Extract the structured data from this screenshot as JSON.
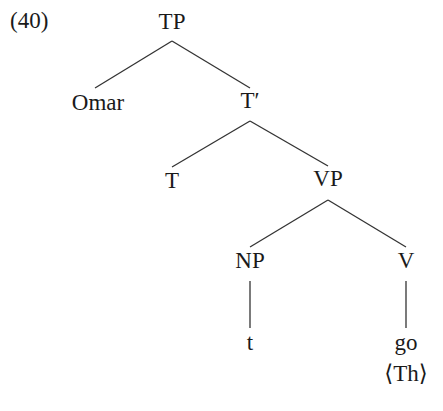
{
  "example_number": "(40)",
  "tree": {
    "nodes": [
      {
        "id": "TP",
        "label": "TP",
        "x": 172,
        "y": 9
      },
      {
        "id": "Omar",
        "label": "Omar",
        "x": 98,
        "y": 90
      },
      {
        "id": "Tbar",
        "label": "T′",
        "x": 250,
        "y": 88
      },
      {
        "id": "T",
        "label": "T",
        "x": 172,
        "y": 168
      },
      {
        "id": "VP",
        "label": "VP",
        "x": 328,
        "y": 166
      },
      {
        "id": "NP",
        "label": "NP",
        "x": 250,
        "y": 248
      },
      {
        "id": "V",
        "label": "V",
        "x": 406,
        "y": 248
      },
      {
        "id": "t",
        "label": "t",
        "x": 250,
        "y": 330
      },
      {
        "id": "go",
        "label": "go",
        "x": 406,
        "y": 330
      },
      {
        "id": "Th",
        "label": "⟨Th⟩",
        "x": 406,
        "y": 361
      }
    ],
    "edges": [
      {
        "from": "TP",
        "to": "Omar",
        "x1": 172,
        "y1": 41,
        "x2": 95,
        "y2": 88
      },
      {
        "from": "TP",
        "to": "Tbar",
        "x1": 172,
        "y1": 41,
        "x2": 250,
        "y2": 88
      },
      {
        "from": "Tbar",
        "to": "T",
        "x1": 250,
        "y1": 121,
        "x2": 172,
        "y2": 167
      },
      {
        "from": "Tbar",
        "to": "VP",
        "x1": 250,
        "y1": 121,
        "x2": 328,
        "y2": 166
      },
      {
        "from": "VP",
        "to": "NP",
        "x1": 328,
        "y1": 200,
        "x2": 250,
        "y2": 247
      },
      {
        "from": "VP",
        "to": "V",
        "x1": 328,
        "y1": 200,
        "x2": 406,
        "y2": 247
      },
      {
        "from": "NP",
        "to": "t",
        "x1": 250,
        "y1": 281,
        "x2": 250,
        "y2": 328
      },
      {
        "from": "V",
        "to": "go",
        "x1": 406,
        "y1": 281,
        "x2": 406,
        "y2": 328
      }
    ]
  },
  "colors": {
    "ink": "#1a1a1a",
    "line": "#333333",
    "background": "#ffffff"
  }
}
